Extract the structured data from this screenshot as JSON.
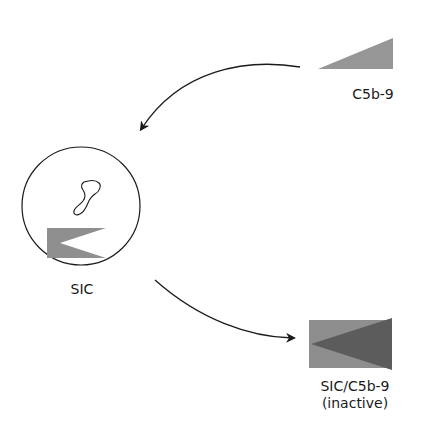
{
  "nodes": {
    "c5b9": {
      "label": "C5b-9"
    },
    "sic": {
      "label": "SIC"
    },
    "complex": {
      "label_line1": "SIC/C5b-9",
      "label_line2": "(inactive)"
    }
  },
  "arrows": [
    {
      "from": "c5b9",
      "to": "sic"
    },
    {
      "from": "sic",
      "to": "complex"
    }
  ],
  "colors": {
    "light_gray": "#9a9a9a",
    "mid_gray": "#8a8a8a",
    "dark_gray": "#5a5a5a",
    "line": "#1a1a1a"
  }
}
